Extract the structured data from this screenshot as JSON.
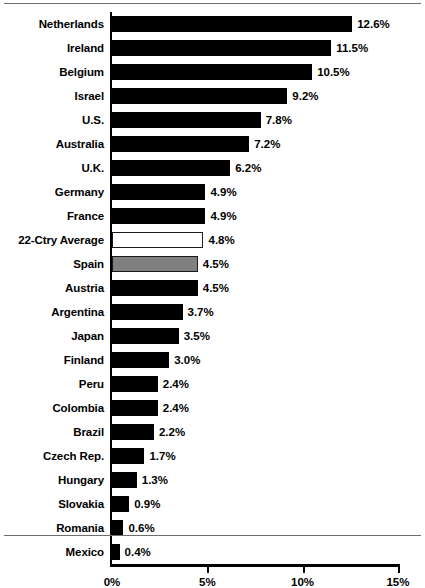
{
  "chart_data": {
    "type": "bar",
    "orientation": "horizontal",
    "title": "",
    "subtitle": "",
    "xlabel": "",
    "ylabel": "",
    "xlim": [
      0,
      15
    ],
    "grid": false,
    "legend": null,
    "value_suffix": "%",
    "x_tick_labels": [
      "0%",
      "5%",
      "10%",
      "15%"
    ],
    "x_tick_values": [
      0,
      5,
      10,
      15
    ],
    "categories": [
      "Netherlands",
      "Ireland",
      "Belgium",
      "Israel",
      "U.S.",
      "Australia",
      "U.K.",
      "Germany",
      "France",
      "22-Ctry Average",
      "Spain",
      "Austria",
      "Argentina",
      "Japan",
      "Finland",
      "Peru",
      "Colombia",
      "Brazil",
      "Czech Rep.",
      "Hungary",
      "Slovakia",
      "Romania",
      "Mexico"
    ],
    "values": [
      12.6,
      11.5,
      10.5,
      9.2,
      7.8,
      7.2,
      6.2,
      4.9,
      4.9,
      4.8,
      4.5,
      4.5,
      3.7,
      3.5,
      3.0,
      2.4,
      2.4,
      2.2,
      1.7,
      1.3,
      0.9,
      0.6,
      0.4
    ],
    "value_labels": [
      "12.6%",
      "11.5%",
      "10.5%",
      "9.2%",
      "7.8%",
      "7.2%",
      "6.2%",
      "4.9%",
      "4.9%",
      "4.8%",
      "4.5%",
      "4.5%",
      "3.7%",
      "3.5%",
      "3.0%",
      "2.4%",
      "2.4%",
      "2.2%",
      "1.7%",
      "1.3%",
      "0.9%",
      "0.6%",
      "0.4%"
    ],
    "bar_styles": [
      "solid",
      "solid",
      "solid",
      "solid",
      "solid",
      "solid",
      "solid",
      "solid",
      "solid",
      "hollow",
      "shaded",
      "solid",
      "solid",
      "solid",
      "solid",
      "solid",
      "solid",
      "solid",
      "solid",
      "solid",
      "solid",
      "solid",
      "solid"
    ],
    "colors": {
      "bar_solid": "#000000",
      "bar_hollow": "#ffffff",
      "bar_shaded": "#808080",
      "bar_outline": "#1a1a1a",
      "axis": "#000000",
      "text": "#000000",
      "background": "#ffffff",
      "page_rule": "#6e6e6e"
    }
  }
}
